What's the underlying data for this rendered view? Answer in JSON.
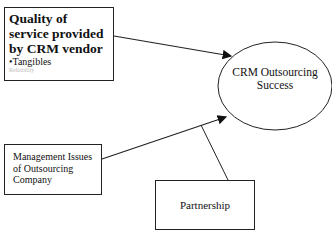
{
  "diagram": {
    "quality_box": {
      "title": "Quality of service provided by CRM vendor",
      "bullet": "•Tangibles",
      "faded_line": "Reliability"
    },
    "management_box": {
      "label": "Management Issues of Outsourcing Company"
    },
    "partnership_box": {
      "label": "Partnership"
    },
    "outcome_ellipse": {
      "label": "CRM Outsourcing Success"
    },
    "edges": [
      {
        "from": "Quality of service provided by CRM vendor",
        "to": "CRM Outsourcing Success",
        "arrow": true
      },
      {
        "from": "Management Issues of Outsourcing Company",
        "to": "CRM Outsourcing Success",
        "arrow": true
      },
      {
        "from": "Partnership",
        "to": "Management-to-Success edge",
        "arrow": false
      }
    ],
    "colors": {
      "stroke": "#222222",
      "background": "#ffffff"
    }
  }
}
